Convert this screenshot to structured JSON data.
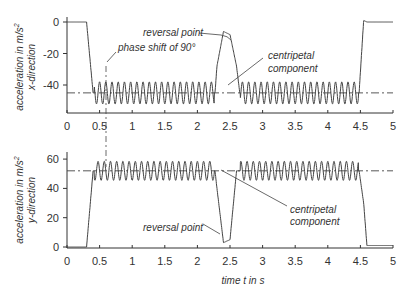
{
  "chart_data": [
    {
      "type": "line",
      "panel": "top",
      "ylabel": "acceleration in m/s² x-direction",
      "ylabel_line1": "acceleration in m/s",
      "ylabel_sup": "2",
      "ylabel_line2": "x-direction",
      "xlim": [
        0,
        5
      ],
      "ylim": [
        -58,
        3
      ],
      "yticks": [
        0,
        -20,
        -40
      ],
      "ytick_labels": [
        "0",
        "-20",
        "-40"
      ],
      "xticks": [
        0,
        0.5,
        1,
        1.5,
        2,
        2.5,
        3,
        3.5,
        4,
        4.5,
        5
      ],
      "xtick_labels": [
        "0",
        "0.5",
        "1",
        "1.5",
        "2",
        "2.5",
        "3",
        "3.5",
        "4",
        "4.5",
        "5"
      ],
      "reference_line": {
        "style": "dash-dot",
        "value": -45,
        "label": "centripetal component"
      },
      "series": [
        {
          "name": "acceleration x",
          "description": "0 until ~0.3 s, drops to oscillation about -45 (amplitude ~7, ~10.5 Hz) from ~0.4 to ~2.27 s, rises to ~-6 peak (reversal point) around 2.4 s, oscillation resumes ~2.65 to ~4.48 s, returns to ~0 after 4.55 s",
          "x": [
            0,
            0.3,
            0.4,
            2.27,
            2.3,
            2.4,
            2.5,
            2.6,
            2.65,
            4.48,
            4.55,
            4.6,
            5
          ],
          "y": [
            0,
            0,
            -45,
            -45,
            -28,
            -6,
            -8,
            -28,
            -45,
            -45,
            1,
            0,
            0
          ]
        }
      ],
      "annotations": [
        {
          "text": "reversal point",
          "x": 2.45,
          "y": -6
        },
        {
          "text": "phase shift of 90°",
          "x": 0.6,
          "y": -28
        },
        {
          "text": "centripetal",
          "x": 2.4,
          "y": -44
        },
        {
          "text": "component",
          "x": 2.4,
          "y": -44
        }
      ]
    },
    {
      "type": "line",
      "panel": "bottom",
      "ylabel": "acceleration in m/s² y-direction",
      "ylabel_line1": "acceleration in m/s",
      "ylabel_sup": "2",
      "ylabel_line2": "y-direction",
      "xlabel": "time t in s",
      "xlim": [
        0,
        5
      ],
      "ylim": [
        -1,
        65
      ],
      "yticks": [
        0,
        20,
        40,
        60
      ],
      "ytick_labels": [
        "0",
        "20",
        "40",
        "60"
      ],
      "xticks": [
        0,
        0.5,
        1,
        1.5,
        2,
        2.5,
        3,
        3.5,
        4,
        4.5,
        5
      ],
      "xtick_labels": [
        "0",
        "0.5",
        "1",
        "1.5",
        "2",
        "2.5",
        "3",
        "3.5",
        "4",
        "4.5",
        "5"
      ],
      "reference_line": {
        "style": "dash-dot",
        "value": 52,
        "label": "centripetal component"
      },
      "series": [
        {
          "name": "acceleration y",
          "description": "0 until ~0.3 s, rises to oscillation about 52 (amplitude ~7, ~10.5 Hz, 90° phase shifted vs x) from ~0.4 to ~2.27 s, drops to ~3 minimum (reversal point) around 2.4 s, oscillation resumes ~2.6 to ~4.48 s, drops to ~1 after 4.55 s",
          "x": [
            0,
            0.3,
            0.4,
            2.27,
            2.3,
            2.4,
            2.5,
            2.6,
            4.48,
            4.55,
            4.6,
            5
          ],
          "y": [
            0,
            0,
            52,
            52,
            40,
            3,
            5,
            52,
            52,
            30,
            1,
            1
          ]
        }
      ],
      "annotations": [
        {
          "text": "reversal point",
          "x": 1.5,
          "y": 10
        },
        {
          "text": "centripetal",
          "x": 3.7,
          "y": 30
        },
        {
          "text": "component",
          "x": 3.7,
          "y": 30
        }
      ]
    }
  ],
  "labels": {
    "reversal_point": "reversal point",
    "phase_shift": "phase shift of 90°",
    "centripetal": "centripetal",
    "component": "component",
    "xlabel": "time t in s",
    "ylabel_top_1": "acceleration in m/s",
    "ylabel_top_sup": "2",
    "ylabel_top_2": "x-direction",
    "ylabel_bot_1": "acceleration in m/s",
    "ylabel_bot_sup": "2",
    "ylabel_bot_2": "y-direction"
  },
  "wave": {
    "freq_hz": 10.5,
    "amp_top": 7,
    "amp_bottom": 6.5,
    "mid_top": -45,
    "mid_bottom": 52,
    "seg1": [
      0.42,
      2.26
    ],
    "seg2": [
      2.66,
      4.47
    ]
  },
  "colors": {
    "line": "#444444",
    "axis": "#333333",
    "text": "#333333"
  }
}
